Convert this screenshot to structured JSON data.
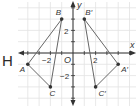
{
  "problem_label": "H",
  "graph": {
    "origin_px": [
      73,
      53
    ],
    "unit_px": 11.3,
    "x_axis_label": "x",
    "y_axis_label": "y",
    "origin_label": "O",
    "tick_labels": {
      "x_neg2": "−2",
      "x_pos2": "2",
      "y_pos2": "2",
      "y_neg2": "−2"
    },
    "colors": {
      "grid": "#e2e2e2",
      "axis": "#333333",
      "segment": "#666666",
      "point": "#333333"
    }
  },
  "figures": {
    "original": {
      "points": [
        {
          "name": "A",
          "label": "A",
          "x": -4,
          "y": -1
        },
        {
          "name": "B",
          "label": "B",
          "x": -1,
          "y": 3
        },
        {
          "name": "C",
          "label": "C",
          "x": -2,
          "y": -3
        }
      ]
    },
    "image": {
      "points": [
        {
          "name": "A'",
          "label": "A′",
          "x": 4,
          "y": -1
        },
        {
          "name": "B'",
          "label": "B′",
          "x": 1,
          "y": 3
        },
        {
          "name": "C'",
          "label": "C′",
          "x": 2,
          "y": -3
        }
      ]
    }
  }
}
